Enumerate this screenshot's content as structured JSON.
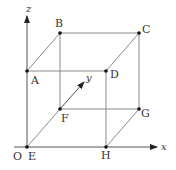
{
  "diagram": {
    "type": "3d-cube-on-axes",
    "colors": {
      "line": "#8a8a8a",
      "axis": "#555555",
      "point": "#111111",
      "text": "#333333"
    },
    "axes": [
      {
        "name": "x",
        "label": "x"
      },
      {
        "name": "y",
        "label": "y"
      },
      {
        "name": "z",
        "label": "z"
      }
    ],
    "origin_label": "O",
    "vertices": [
      {
        "id": "A",
        "label": "A"
      },
      {
        "id": "B",
        "label": "B"
      },
      {
        "id": "C",
        "label": "C"
      },
      {
        "id": "D",
        "label": "D"
      },
      {
        "id": "E",
        "label": "E"
      },
      {
        "id": "F",
        "label": "F"
      },
      {
        "id": "G",
        "label": "G"
      },
      {
        "id": "H",
        "label": "H"
      }
    ],
    "edges": [
      "A-B",
      "B-C",
      "C-D",
      "D-A",
      "E-F",
      "F-G",
      "G-H",
      "H-E",
      "A-E",
      "B-F",
      "C-G",
      "D-H"
    ]
  }
}
